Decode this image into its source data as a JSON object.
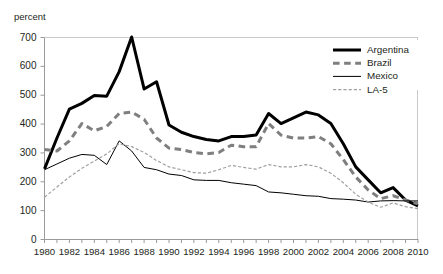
{
  "chart_data": {
    "type": "line",
    "title": "",
    "ylabel": "percent",
    "xlabel": "",
    "ylim": [
      0,
      700
    ],
    "xlim": [
      1980,
      2010
    ],
    "y_ticks": [
      0,
      100,
      200,
      300,
      400,
      500,
      600,
      700
    ],
    "x_ticks": [
      1980,
      1981,
      1982,
      1983,
      1984,
      1985,
      1986,
      1987,
      1988,
      1989,
      1990,
      1991,
      1992,
      1993,
      1994,
      1995,
      1996,
      1997,
      1998,
      1999,
      2000,
      2001,
      2002,
      2003,
      2004,
      2005,
      2006,
      2007,
      2008,
      2009,
      2010
    ],
    "x_tick_labels": [
      "1980",
      "1982",
      "1984",
      "1986",
      "1988",
      "1990",
      "1992",
      "1994",
      "1996",
      "1998",
      "2000",
      "2002",
      "2004",
      "2006",
      "2008",
      "2010"
    ],
    "x_tick_label_years": [
      1980,
      1982,
      1984,
      1986,
      1988,
      1990,
      1992,
      1994,
      1996,
      1998,
      2000,
      2002,
      2004,
      2006,
      2008,
      2010
    ],
    "grid": false,
    "legend_position": "top-right",
    "x": [
      1980,
      1981,
      1982,
      1983,
      1984,
      1985,
      1986,
      1987,
      1988,
      1989,
      1990,
      1991,
      1992,
      1993,
      1994,
      1995,
      1996,
      1997,
      1998,
      1999,
      2000,
      2001,
      2002,
      2003,
      2004,
      2005,
      2006,
      2007,
      2008,
      2009,
      2010
    ],
    "series": [
      {
        "name": "Argentina",
        "color": "#000000",
        "style": "solid",
        "width": 3.0,
        "values": [
          243,
          350,
          450,
          470,
          497,
          495,
          580,
          700,
          520,
          545,
          395,
          370,
          355,
          345,
          340,
          355,
          355,
          360,
          435,
          400,
          420,
          440,
          430,
          400,
          330,
          250,
          205,
          160,
          178,
          135,
          115
        ]
      },
      {
        "name": "Brazil",
        "color": "#7f7f7f",
        "style": "dashed",
        "width": 3.0,
        "values": [
          310,
          305,
          340,
          400,
          375,
          390,
          435,
          440,
          415,
          350,
          315,
          310,
          300,
          295,
          300,
          325,
          320,
          320,
          400,
          360,
          350,
          350,
          355,
          330,
          275,
          215,
          170,
          140,
          150,
          135,
          122
        ]
      },
      {
        "name": "Mexico",
        "color": "#000000",
        "style": "solid",
        "width": 1.0,
        "values": [
          240,
          260,
          280,
          293,
          290,
          258,
          340,
          305,
          248,
          240,
          225,
          220,
          205,
          203,
          203,
          195,
          190,
          185,
          163,
          160,
          155,
          150,
          148,
          140,
          138,
          135,
          128,
          132,
          133,
          132,
          132
        ]
      },
      {
        "name": "LA-5",
        "color": "#a0a0a0",
        "style": "dotted-dashed",
        "width": 1.2,
        "values": [
          145,
          180,
          215,
          245,
          270,
          295,
          330,
          320,
          300,
          272,
          250,
          240,
          230,
          228,
          240,
          255,
          248,
          242,
          258,
          250,
          250,
          258,
          250,
          228,
          195,
          155,
          128,
          110,
          125,
          112,
          105
        ]
      }
    ]
  },
  "legend": {
    "items": [
      {
        "label": "Argentina"
      },
      {
        "label": "Brazil"
      },
      {
        "label": "Mexico"
      },
      {
        "label": "LA-5"
      }
    ]
  }
}
